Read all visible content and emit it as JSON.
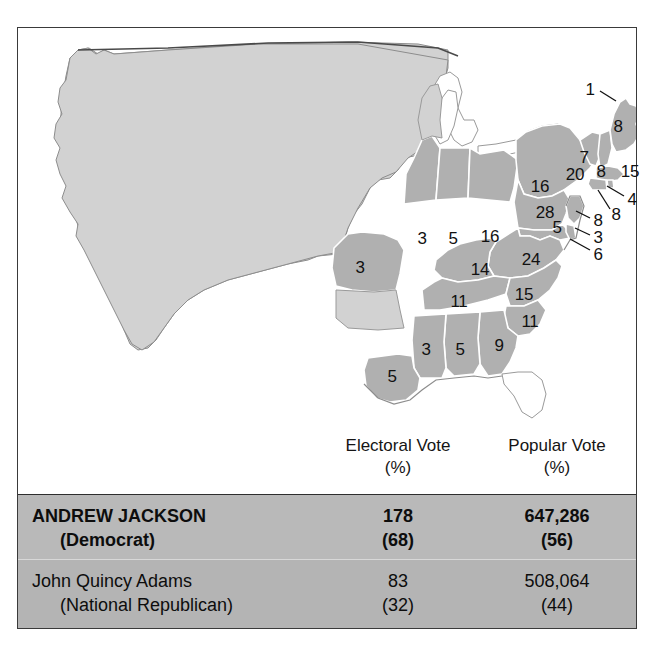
{
  "figure": {
    "map_title": "United States presidential election results by state",
    "colors": {
      "territory_fill": "#d2d2d2",
      "state_fill": "#b0b0b0",
      "state_border": "#ffffff",
      "outline": "#6e6e6e",
      "frame": "#3a3a3a",
      "winner_row_bg": "#b9b9b9",
      "runnerup_row_bg": "#b4b4b4",
      "label_text": "#111111"
    }
  },
  "map": {
    "state_labels": [
      {
        "name": "maine-upper",
        "value": "1",
        "x": 572,
        "y": 61,
        "leader": true,
        "lx1": 582,
        "ly1": 63,
        "lx2": 598,
        "ly2": 73
      },
      {
        "name": "maine",
        "value": "8",
        "x": 600,
        "y": 98,
        "leader": false
      },
      {
        "name": "new-hampshire",
        "value": "7",
        "x": 566,
        "y": 129,
        "leader": false
      },
      {
        "name": "vermont",
        "value": "8",
        "x": 583,
        "y": 143,
        "leader": false
      },
      {
        "name": "massachusetts",
        "value": "15",
        "x": 612,
        "y": 143,
        "leader": false
      },
      {
        "name": "new-york",
        "value": "20",
        "x": 557,
        "y": 146,
        "leader": false
      },
      {
        "name": "new-york-adams",
        "value": "16",
        "x": 522,
        "y": 158,
        "leader": false
      },
      {
        "name": "rhode-island",
        "value": "4",
        "x": 614,
        "y": 171,
        "leader": true,
        "lx1": 606,
        "ly1": 168,
        "lx2": 589,
        "ly2": 158
      },
      {
        "name": "connecticut",
        "value": "8",
        "x": 598,
        "y": 186,
        "leader": true,
        "lx1": 592,
        "ly1": 181,
        "lx2": 580,
        "ly2": 162
      },
      {
        "name": "pennsylvania",
        "value": "28",
        "x": 527,
        "y": 184,
        "leader": false
      },
      {
        "name": "new-jersey",
        "value": "8",
        "x": 580,
        "y": 192,
        "leader": true,
        "lx1": 572,
        "ly1": 190,
        "lx2": 558,
        "ly2": 183
      },
      {
        "name": "maryland",
        "value": "5",
        "x": 539,
        "y": 199,
        "leader": false
      },
      {
        "name": "delaware",
        "value": "3",
        "x": 580,
        "y": 209,
        "leader": true,
        "lx1": 572,
        "ly1": 207,
        "lx2": 557,
        "ly2": 200
      },
      {
        "name": "maryland-adams",
        "value": "6",
        "x": 580,
        "y": 226,
        "leader": true,
        "lx1": 572,
        "ly1": 222,
        "lx2": 552,
        "ly2": 211
      },
      {
        "name": "ohio",
        "value": "16",
        "x": 472,
        "y": 208,
        "leader": false
      },
      {
        "name": "indiana",
        "value": "5",
        "x": 435,
        "y": 210,
        "leader": false
      },
      {
        "name": "illinois",
        "value": "3",
        "x": 404,
        "y": 210,
        "leader": false
      },
      {
        "name": "missouri",
        "value": "3",
        "x": 342,
        "y": 239,
        "leader": false
      },
      {
        "name": "kentucky",
        "value": "14",
        "x": 462,
        "y": 241,
        "leader": false
      },
      {
        "name": "virginia",
        "value": "24",
        "x": 513,
        "y": 231,
        "leader": false
      },
      {
        "name": "tennessee",
        "value": "11",
        "x": 441,
        "y": 273,
        "leader": false
      },
      {
        "name": "north-carolina",
        "value": "15",
        "x": 506,
        "y": 266,
        "leader": false
      },
      {
        "name": "south-carolina",
        "value": "11",
        "x": 512,
        "y": 293,
        "leader": false
      },
      {
        "name": "mississippi",
        "value": "3",
        "x": 408,
        "y": 321,
        "leader": false
      },
      {
        "name": "alabama",
        "value": "5",
        "x": 442,
        "y": 321,
        "leader": false
      },
      {
        "name": "georgia",
        "value": "9",
        "x": 481,
        "y": 317,
        "leader": false
      },
      {
        "name": "louisiana",
        "value": "5",
        "x": 374,
        "y": 348,
        "leader": false
      }
    ]
  },
  "table": {
    "headers": {
      "candidate": "",
      "electoral_line1": "Electoral Vote",
      "electoral_line2": "(%)",
      "popular_line1": "Popular Vote",
      "popular_line2": "(%)"
    },
    "rows": [
      {
        "id": "jackson",
        "name": "ANDREW JACKSON",
        "party": "(Democrat)",
        "electoral": "178",
        "electoral_pct": "(68)",
        "popular": "647,286",
        "popular_pct": "(56)",
        "winner": true
      },
      {
        "id": "adams",
        "name": "John Quincy Adams",
        "party": "(National Republican)",
        "electoral": "83",
        "electoral_pct": "(32)",
        "popular": "508,064",
        "popular_pct": "(44)",
        "winner": false
      }
    ]
  },
  "chart_data": {
    "type": "table",
    "columns": [
      "Candidate",
      "Electoral Vote (%)",
      "Popular Vote (%)"
    ],
    "rows": [
      [
        "ANDREW JACKSON (Democrat)",
        "178 (68)",
        "647,286 (56)"
      ],
      [
        "John Quincy Adams (National Republican)",
        "83 (32)",
        "508,064 (44)"
      ]
    ],
    "electoral_votes": {
      "Andrew Jackson": 178,
      "John Quincy Adams": 83
    },
    "electoral_pct": {
      "Andrew Jackson": 68,
      "John Quincy Adams": 32
    },
    "popular_votes": {
      "Andrew Jackson": 647286,
      "John Quincy Adams": 508064
    },
    "popular_pct": {
      "Andrew Jackson": 56,
      "John Quincy Adams": 44
    },
    "map_state_electoral_votes": {
      "Maine (split)": [
        1,
        8
      ],
      "New Hampshire": 7,
      "Vermont": 8,
      "Massachusetts": 15,
      "Rhode Island": 4,
      "Connecticut": 8,
      "New York (split)": [
        20,
        16
      ],
      "New Jersey": 8,
      "Pennsylvania": 28,
      "Delaware": 3,
      "Maryland (split)": [
        5,
        6
      ],
      "Virginia": 24,
      "North Carolina": 15,
      "South Carolina": 11,
      "Georgia": 9,
      "Alabama": 5,
      "Mississippi": 3,
      "Louisiana": 5,
      "Tennessee": 11,
      "Kentucky": 14,
      "Ohio": 16,
      "Indiana": 5,
      "Illinois": 3,
      "Missouri": 3
    }
  }
}
